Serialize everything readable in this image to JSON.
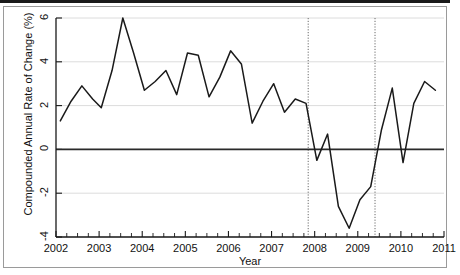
{
  "chart_data": {
    "type": "line",
    "title": "",
    "xlabel": "Year",
    "ylabel": "Compounded Annual Rate of Change (%)",
    "xlim": [
      2002.0,
      2011.0
    ],
    "ylim": [
      -4,
      6
    ],
    "grid": true,
    "legend": "none",
    "x_ticks": [
      2002,
      2003,
      2004,
      2005,
      2006,
      2007,
      2008,
      2009,
      2010,
      2011
    ],
    "x_tick_labels": [
      "2002",
      "2003",
      "2004",
      "2005",
      "2006",
      "2007",
      "2008",
      "2009",
      "2010",
      "2011"
    ],
    "x_minor_tick_interval": 0.25,
    "y_ticks": [
      -4,
      -2,
      0,
      2,
      4,
      6
    ],
    "y_tick_labels": [
      "-4",
      "-2",
      "0",
      "2",
      "4",
      "6"
    ],
    "zero_line": 0,
    "annotations": [
      {
        "type": "vline",
        "style": "dotted",
        "x": 2007.85,
        "label": "recession start"
      },
      {
        "type": "vline",
        "style": "dotted",
        "x": 2009.4,
        "label": "recession end"
      }
    ],
    "series": [
      {
        "name": "Compounded annual rate of change",
        "color": "#1a1a1a",
        "x": [
          2002.1,
          2002.35,
          2002.6,
          2002.85,
          2003.05,
          2003.3,
          2003.55,
          2003.8,
          2004.05,
          2004.3,
          2004.55,
          2004.8,
          2005.05,
          2005.3,
          2005.55,
          2005.8,
          2006.05,
          2006.3,
          2006.55,
          2006.8,
          2007.05,
          2007.3,
          2007.55,
          2007.8,
          2008.05,
          2008.3,
          2008.55,
          2008.8,
          2009.05,
          2009.3,
          2009.55,
          2009.8,
          2010.05,
          2010.3,
          2010.55,
          2010.8
        ],
        "values": [
          1.3,
          2.2,
          2.9,
          2.3,
          1.9,
          3.6,
          6.0,
          4.4,
          2.7,
          3.1,
          3.6,
          2.5,
          4.4,
          4.3,
          2.4,
          3.3,
          4.5,
          3.9,
          1.2,
          2.2,
          3.0,
          1.7,
          2.3,
          2.1,
          -0.5,
          0.7,
          -2.6,
          -3.6,
          -2.3,
          -1.7,
          0.9,
          2.8,
          -0.6,
          2.1,
          3.1,
          2.7
        ]
      }
    ]
  }
}
